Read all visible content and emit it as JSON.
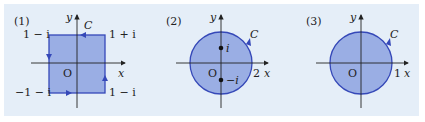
{
  "figures": [
    {
      "label": "(1)",
      "shape": "square",
      "curve_label": "C",
      "axis_x": "x",
      "axis_y": "y",
      "origin": "O",
      "corners": {
        "top_left": "1 − i",
        "top_right": "1 + i",
        "bottom_left": "−1 − i",
        "bottom_right": "1 − i"
      }
    },
    {
      "label": "(2)",
      "shape": "circle",
      "curve_label": "C",
      "axis_x": "x",
      "axis_y": "y",
      "origin": "O",
      "x_tick": "2",
      "points": [
        "i",
        "−i"
      ]
    },
    {
      "label": "(3)",
      "shape": "circle",
      "curve_label": "C",
      "axis_x": "x",
      "axis_y": "y",
      "origin": "O",
      "x_tick": "1"
    }
  ],
  "colors": {
    "fill": "#8fa6e0",
    "stroke": "#3548b8",
    "background": "#e5eef8"
  }
}
